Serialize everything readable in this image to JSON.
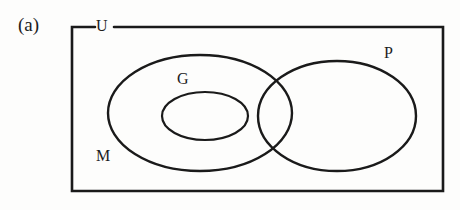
{
  "figure": {
    "panel_label": "(a)",
    "type": "venn-diagram",
    "background_color": "#fdfdfc",
    "stroke_color": "#1a1a1a"
  },
  "labels": {
    "universe": "U",
    "set_m": "M",
    "set_g": "G",
    "set_p": "P"
  },
  "chart_data": {
    "type": "diagram",
    "title": "(a)",
    "universe": {
      "label": "U",
      "shape": "rectangle",
      "x": 72,
      "y": 27,
      "width": 371,
      "height": 164,
      "label_gap_start": 95,
      "label_gap_end": 114
    },
    "sets": [
      {
        "label": "M",
        "shape": "ellipse",
        "cx": 200,
        "cy": 113,
        "rx": 92,
        "ry": 58,
        "label_x": 100,
        "label_y": 158
      },
      {
        "label": "G",
        "shape": "ellipse",
        "cx": 205,
        "cy": 116,
        "rx": 43,
        "ry": 24,
        "label_x": 183,
        "label_y": 80
      },
      {
        "label": "P",
        "shape": "ellipse",
        "cx": 337,
        "cy": 116,
        "rx": 79,
        "ry": 55,
        "label_x": 389,
        "label_y": 54
      }
    ],
    "relations": [
      "G is a proper subset of M",
      "M and P overlap (intersect)",
      "G is disjoint from P",
      "M, G and P are all contained in U"
    ]
  }
}
